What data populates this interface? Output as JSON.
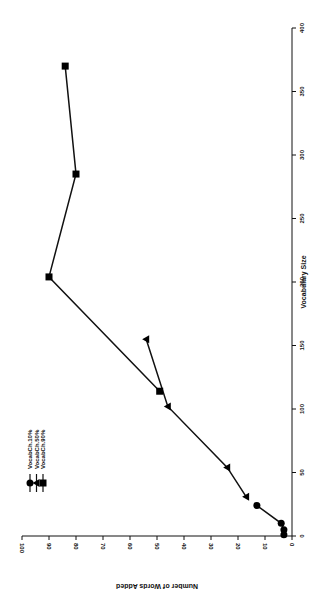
{
  "chart_data": {
    "type": "line",
    "title": "",
    "orientation": "rotated-90",
    "xlabel": "Vocabulary Size",
    "ylabel": "Number of Words Added",
    "xlim": [
      0,
      400
    ],
    "ylim": [
      0,
      100
    ],
    "xticks": [
      "0",
      "50",
      "100",
      "150",
      "200",
      "250",
      "300",
      "350",
      "400"
    ],
    "yticks": [
      "0",
      "10",
      "20",
      "30",
      "40",
      "50",
      "60",
      "70",
      "80",
      "90",
      "100"
    ],
    "grid": false,
    "legend_position": "upper-left (rotated)",
    "series": [
      {
        "name": "VocabCh.10%",
        "marker": "circle",
        "x": [
          1,
          5,
          10,
          24
        ],
        "y": [
          3,
          3,
          4,
          13
        ]
      },
      {
        "name": "VocabCh.50%",
        "marker": "triangle",
        "x": [
          31,
          54,
          102,
          155
        ],
        "y": [
          17,
          24,
          46,
          54
        ]
      },
      {
        "name": "VocabCh.90%",
        "marker": "square",
        "x": [
          114,
          204,
          285,
          370
        ],
        "y": [
          49,
          90,
          80,
          84
        ]
      }
    ]
  }
}
